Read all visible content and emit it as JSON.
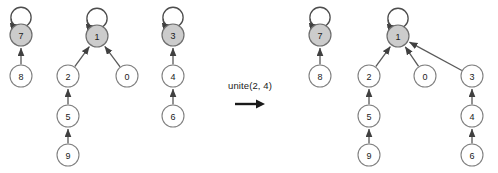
{
  "figure": {
    "title": "",
    "operation_label": "unite(2, 4)",
    "operation_arrow_icon": "right-arrow-icon",
    "colors": {
      "background": "#ffffff",
      "node_fill": "#ffffff",
      "node_stroke": "#808080",
      "root_fill": "#cccccc",
      "root_stroke": "#6e6e6e",
      "edge": "#595959",
      "text": "#1a1a1a"
    },
    "node_radius": 11,
    "left": {
      "name": "before-state",
      "nodes": [
        {
          "id": "7",
          "label": "7",
          "x": 21,
          "y": 35,
          "root": true
        },
        {
          "id": "8",
          "label": "8",
          "x": 21,
          "y": 76,
          "root": false
        },
        {
          "id": "1",
          "label": "1",
          "x": 97,
          "y": 36,
          "root": true
        },
        {
          "id": "2",
          "label": "2",
          "x": 68,
          "y": 76,
          "root": false
        },
        {
          "id": "0",
          "label": "0",
          "x": 127,
          "y": 76,
          "root": false
        },
        {
          "id": "5",
          "label": "5",
          "x": 68,
          "y": 116,
          "root": false
        },
        {
          "id": "9",
          "label": "9",
          "x": 68,
          "y": 155,
          "root": false
        },
        {
          "id": "3",
          "label": "3",
          "x": 173,
          "y": 35,
          "root": true
        },
        {
          "id": "4",
          "label": "4",
          "x": 173,
          "y": 76,
          "root": false
        },
        {
          "id": "6",
          "label": "6",
          "x": 173,
          "y": 116,
          "root": false
        }
      ],
      "edges": [
        {
          "from": "8",
          "to": "7"
        },
        {
          "from": "2",
          "to": "1"
        },
        {
          "from": "0",
          "to": "1"
        },
        {
          "from": "5",
          "to": "2"
        },
        {
          "from": "9",
          "to": "5"
        },
        {
          "from": "4",
          "to": "3"
        },
        {
          "from": "6",
          "to": "4"
        }
      ],
      "self_loops": [
        "7",
        "1",
        "3"
      ]
    },
    "right": {
      "name": "after-state",
      "nodes": [
        {
          "id": "7",
          "label": "7",
          "x": 320,
          "y": 35,
          "root": true
        },
        {
          "id": "8",
          "label": "8",
          "x": 320,
          "y": 76,
          "root": false
        },
        {
          "id": "1",
          "label": "1",
          "x": 398,
          "y": 36,
          "root": true
        },
        {
          "id": "2",
          "label": "2",
          "x": 369,
          "y": 76,
          "root": false
        },
        {
          "id": "0",
          "label": "0",
          "x": 425,
          "y": 76,
          "root": false
        },
        {
          "id": "3",
          "label": "3",
          "x": 472,
          "y": 76,
          "root": false
        },
        {
          "id": "5",
          "label": "5",
          "x": 369,
          "y": 116,
          "root": false
        },
        {
          "id": "9",
          "label": "9",
          "x": 369,
          "y": 155,
          "root": false
        },
        {
          "id": "4",
          "label": "4",
          "x": 472,
          "y": 116,
          "root": false
        },
        {
          "id": "6",
          "label": "6",
          "x": 472,
          "y": 155,
          "root": false
        }
      ],
      "edges": [
        {
          "from": "8",
          "to": "7"
        },
        {
          "from": "2",
          "to": "1"
        },
        {
          "from": "0",
          "to": "1"
        },
        {
          "from": "3",
          "to": "1"
        },
        {
          "from": "5",
          "to": "2"
        },
        {
          "from": "9",
          "to": "5"
        },
        {
          "from": "4",
          "to": "3"
        },
        {
          "from": "6",
          "to": "4"
        }
      ],
      "self_loops": [
        "7",
        "1"
      ]
    }
  }
}
